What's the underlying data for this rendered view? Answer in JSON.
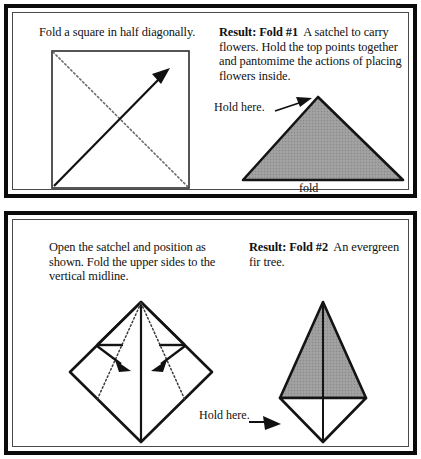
{
  "document": {
    "type": "origami-instruction-sheet",
    "title": "Paper folding instructions: satchel and fir tree"
  },
  "colors": {
    "ink": "#111111",
    "frame_outer": "#0b0b0b",
    "frame_inner": "#4a4a4a",
    "paper_fill_gray": "#9a9a9a",
    "paper_white": "#ffffff"
  },
  "panels": [
    {
      "id": "panel-top",
      "name": "fold-1-panel",
      "left": {
        "instruction": "Fold a square in half diagonally.",
        "figure": {
          "name": "square-with-diagonal-fold",
          "shape": "square",
          "fold_line_style": "dotted",
          "fold_line": "top-left to bottom-right",
          "arrow": "bottom-left to top-right"
        }
      },
      "right": {
        "heading": "Result: Fold #1",
        "body": "A satchel to carry flowers. Hold the top points together and pantomime the actions of placing flowers inside.",
        "figure": {
          "name": "satchel-triangle",
          "shape": "triangle",
          "fill": "gray",
          "base_label": "fold",
          "callout": "Hold here.",
          "callout_arrow": "points to triangle apex"
        }
      }
    },
    {
      "id": "panel-bottom",
      "name": "fold-2-panel",
      "left": {
        "instruction": "Open the satchel and position as shown. Fold the upper sides to the vertical midline.",
        "figure": {
          "name": "diamond-with-fold-lines",
          "shape": "diamond",
          "fold_line_style": "dotted",
          "midline": "vertical",
          "arrows": 2,
          "arrow_direction": "inward toward vertical midline"
        }
      },
      "right": {
        "heading": "Result: Fold #2",
        "body": "An evergreen fir tree.",
        "figure": {
          "name": "fir-tree",
          "shape": "triangle-over-diamond",
          "fill_top": "gray",
          "fill_bottom": "white",
          "callout": "Hold here.",
          "callout_arrow": "points to lower-left edge of trunk"
        }
      }
    }
  ]
}
